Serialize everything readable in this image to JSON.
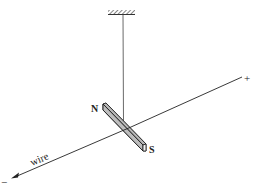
{
  "diagram": {
    "labels": {
      "north": "N",
      "south": "S",
      "wire": "wire",
      "positive": "+",
      "negative": "−"
    },
    "colors": {
      "line": "#222222",
      "magnet_face": "#b8b8b8",
      "magnet_edge": "#1a1a1a",
      "magnet_side": "#e6e6e6",
      "background": "#ffffff"
    }
  }
}
